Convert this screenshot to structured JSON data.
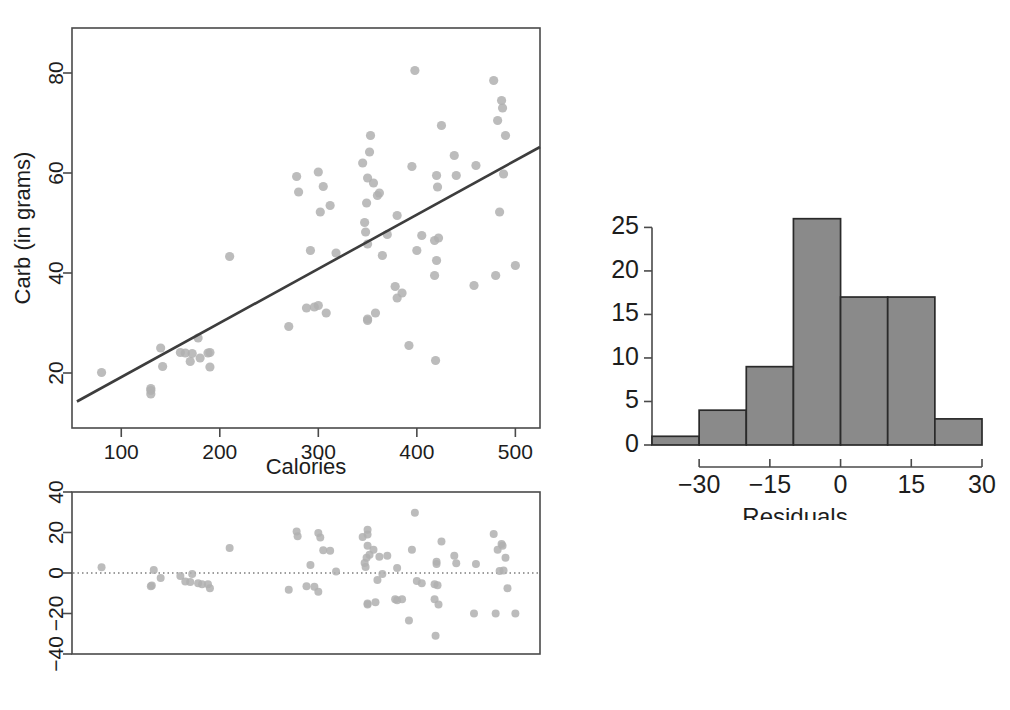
{
  "figure": {
    "panels": [
      "scatter-with-regression",
      "residual-plot",
      "residual-histogram"
    ]
  },
  "chart_data": [
    {
      "type": "scatter",
      "name": "calories-vs-carb",
      "title": "",
      "xlabel": "Calories",
      "ylabel": "Carb (in grams)",
      "xlim": [
        50,
        525
      ],
      "ylim": [
        9,
        89
      ],
      "xticks": [
        100,
        200,
        300,
        400,
        500
      ],
      "yticks": [
        20,
        40,
        60,
        80
      ],
      "grid": false,
      "legend": "none",
      "regression_line": {
        "x": [
          55,
          525
        ],
        "y": [
          14.3,
          65.2
        ]
      },
      "points": [
        [
          80,
          20.1
        ],
        [
          130,
          16.5
        ],
        [
          130,
          15.8
        ],
        [
          130,
          16.9
        ],
        [
          140,
          25.0
        ],
        [
          142,
          21.3
        ],
        [
          160,
          24.1
        ],
        [
          165,
          24.0
        ],
        [
          170,
          22.3
        ],
        [
          172,
          23.9
        ],
        [
          178,
          27.0
        ],
        [
          180,
          23.0
        ],
        [
          188,
          24.0
        ],
        [
          190,
          24.1
        ],
        [
          190,
          21.2
        ],
        [
          210,
          43.3
        ],
        [
          270,
          29.3
        ],
        [
          278,
          59.3
        ],
        [
          280,
          56.2
        ],
        [
          288,
          33.0
        ],
        [
          292,
          44.5
        ],
        [
          296,
          33.2
        ],
        [
          300,
          60.2
        ],
        [
          300,
          33.5
        ],
        [
          302,
          52.2
        ],
        [
          305,
          57.3
        ],
        [
          308,
          32.0
        ],
        [
          312,
          53.5
        ],
        [
          318,
          44.0
        ],
        [
          345,
          62.0
        ],
        [
          347,
          50.1
        ],
        [
          348,
          48.2
        ],
        [
          349,
          54.0
        ],
        [
          350,
          30.5
        ],
        [
          350,
          30.8
        ],
        [
          350,
          45.8
        ],
        [
          350,
          59.0
        ],
        [
          352,
          64.2
        ],
        [
          353,
          67.5
        ],
        [
          356,
          58.0
        ],
        [
          358,
          32.0
        ],
        [
          360,
          55.5
        ],
        [
          362,
          56.0
        ],
        [
          365,
          43.5
        ],
        [
          370,
          47.7
        ],
        [
          378,
          37.3
        ],
        [
          380,
          35.0
        ],
        [
          380,
          51.5
        ],
        [
          385,
          36.0
        ],
        [
          392,
          25.5
        ],
        [
          395,
          61.3
        ],
        [
          398,
          80.5
        ],
        [
          400,
          44.5
        ],
        [
          405,
          47.5
        ],
        [
          418,
          46.5
        ],
        [
          418,
          39.5
        ],
        [
          419,
          22.5
        ],
        [
          420,
          42.5
        ],
        [
          420,
          59.5
        ],
        [
          421,
          57.2
        ],
        [
          422,
          47.0
        ],
        [
          425,
          69.5
        ],
        [
          438,
          63.5
        ],
        [
          440,
          59.5
        ],
        [
          458,
          37.5
        ],
        [
          460,
          61.5
        ],
        [
          478,
          78.5
        ],
        [
          480,
          39.5
        ],
        [
          482,
          70.5
        ],
        [
          484,
          52.2
        ],
        [
          486,
          74.5
        ],
        [
          487,
          73.0
        ],
        [
          488,
          59.8
        ],
        [
          490,
          67.5
        ],
        [
          500,
          41.5
        ]
      ]
    },
    {
      "type": "scatter",
      "name": "residual-plot",
      "title": "",
      "xlabel": "",
      "ylabel": "",
      "xlim": [
        50,
        525
      ],
      "ylim": [
        -40,
        40
      ],
      "xticks": [],
      "yticks": [
        -40,
        -20,
        0,
        20,
        40
      ],
      "grid": false,
      "legend": "none",
      "zero_reference_line": 0,
      "points": [
        [
          80,
          2.8
        ],
        [
          130,
          -6.5
        ],
        [
          131,
          -6.2
        ],
        [
          133,
          1.5
        ],
        [
          140,
          -2.5
        ],
        [
          160,
          -1.5
        ],
        [
          165,
          -4.2
        ],
        [
          170,
          -4.5
        ],
        [
          172,
          -0.5
        ],
        [
          178,
          -5.0
        ],
        [
          182,
          -5.5
        ],
        [
          188,
          -5.6
        ],
        [
          190,
          -7.5
        ],
        [
          210,
          12.3
        ],
        [
          270,
          -8.3
        ],
        [
          278,
          20.5
        ],
        [
          279,
          18.2
        ],
        [
          288,
          -6.5
        ],
        [
          292,
          4.0
        ],
        [
          296,
          -6.8
        ],
        [
          300,
          19.8
        ],
        [
          300,
          -9.3
        ],
        [
          302,
          17.5
        ],
        [
          305,
          11.2
        ],
        [
          312,
          11.0
        ],
        [
          318,
          0.8
        ],
        [
          345,
          17.8
        ],
        [
          347,
          5.0
        ],
        [
          348,
          3.0
        ],
        [
          349,
          7.5
        ],
        [
          350,
          -15.5
        ],
        [
          350,
          -15.0
        ],
        [
          350,
          21.3
        ],
        [
          350,
          19.0
        ],
        [
          350,
          13.5
        ],
        [
          352,
          9.0
        ],
        [
          356,
          11.5
        ],
        [
          358,
          -14.5
        ],
        [
          360,
          -3.5
        ],
        [
          362,
          8.0
        ],
        [
          365,
          -0.5
        ],
        [
          370,
          8.5
        ],
        [
          378,
          -13.0
        ],
        [
          380,
          -13.5
        ],
        [
          380,
          2.5
        ],
        [
          385,
          -13.0
        ],
        [
          392,
          -23.5
        ],
        [
          395,
          11.5
        ],
        [
          398,
          29.8
        ],
        [
          400,
          -4.0
        ],
        [
          405,
          -5.0
        ],
        [
          418,
          -5.5
        ],
        [
          418,
          -13.0
        ],
        [
          419,
          -31.0
        ],
        [
          420,
          5.5
        ],
        [
          420,
          4.5
        ],
        [
          421,
          -6.0
        ],
        [
          422,
          -15.5
        ],
        [
          425,
          15.5
        ],
        [
          438,
          8.5
        ],
        [
          440,
          4.8
        ],
        [
          458,
          -20.0
        ],
        [
          460,
          4.5
        ],
        [
          478,
          19.3
        ],
        [
          480,
          -20.0
        ],
        [
          482,
          11.5
        ],
        [
          484,
          1.0
        ],
        [
          486,
          14.3
        ],
        [
          487,
          13.5
        ],
        [
          488,
          1.2
        ],
        [
          490,
          7.5
        ],
        [
          492,
          -7.5
        ],
        [
          500,
          -20.0
        ]
      ]
    },
    {
      "type": "bar",
      "name": "residual-histogram",
      "title": "",
      "xlabel": "Residuals",
      "ylabel": "",
      "xlim": [
        -40,
        30
      ],
      "ylim": [
        0,
        27
      ],
      "xticks": [
        -30,
        -15,
        0,
        15,
        30
      ],
      "yticks": [
        0,
        5,
        10,
        15,
        20,
        25
      ],
      "grid": false,
      "legend": "none",
      "bin_edges": [
        -40,
        -30,
        -20,
        -10,
        0,
        10,
        20,
        30
      ],
      "categories": [
        "-40 to -30",
        "-30 to -20",
        "-20 to -10",
        "-10 to 0",
        "0 to 10",
        "10 to 20",
        "20 to 30"
      ],
      "values": [
        1,
        4,
        9,
        26,
        17,
        17,
        3
      ]
    }
  ]
}
